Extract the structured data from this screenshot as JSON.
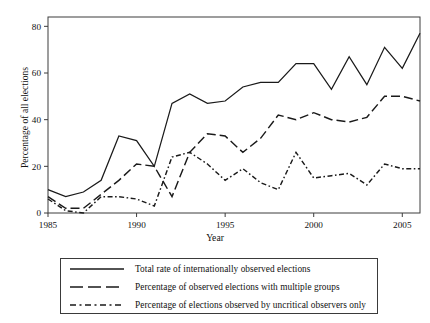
{
  "chart_data": {
    "type": "line",
    "title": "",
    "xlabel": "Year",
    "ylabel": "Percentage of all elections",
    "xlim": [
      1985,
      2006
    ],
    "ylim": [
      0,
      84
    ],
    "yticks": [
      0,
      20,
      40,
      60,
      80
    ],
    "xticks": [
      1985,
      1990,
      1995,
      2000,
      2005
    ],
    "grid": false,
    "legend_position": "below-axes",
    "x": [
      1985,
      1986,
      1987,
      1988,
      1989,
      1990,
      1991,
      1992,
      1993,
      1994,
      1995,
      1996,
      1997,
      1998,
      1999,
      2000,
      2001,
      2002,
      2003,
      2004,
      2005,
      2006
    ],
    "series": [
      {
        "name": "Total rate of internationally observed elections",
        "style": "solid",
        "values": [
          10,
          7,
          9,
          14,
          33,
          31,
          20,
          47,
          51,
          47,
          48,
          54,
          56,
          56,
          64,
          64,
          53,
          67,
          55,
          71,
          62,
          77
        ]
      },
      {
        "name": "Percentage of observed elections with multiple groups",
        "style": "dashed",
        "values": [
          7,
          2,
          2,
          8,
          14,
          21,
          20,
          7,
          26,
          34,
          33,
          26,
          32,
          42,
          40,
          43,
          40,
          39,
          41,
          50,
          50,
          48
        ]
      },
      {
        "name": "Percentage of elections observed by uncritical observers only",
        "style": "dash-dot",
        "values": [
          6,
          1,
          0,
          7,
          7,
          6,
          3,
          24,
          26,
          21,
          14,
          19,
          13,
          10,
          26,
          15,
          16,
          17,
          12,
          21,
          19,
          19
        ]
      }
    ]
  },
  "legend": {
    "items": [
      {
        "label": "Total rate of  internationally observed elections",
        "style": "solid"
      },
      {
        "label": "Percentage of  observed elections with multiple groups",
        "style": "dashed"
      },
      {
        "label": "Percentage of  elections observed by uncritical observers only",
        "style": "dash-dot"
      }
    ]
  },
  "axes": {
    "xlabel": "Year",
    "ylabel": "Percentage of all elections",
    "ytick_labels": [
      "0",
      "20",
      "40",
      "60",
      "80"
    ],
    "xtick_labels": [
      "1985",
      "1990",
      "1995",
      "2000",
      "2005"
    ]
  },
  "colors": {
    "line": "#1a1a1a",
    "frame": "#3c3c3c",
    "background": "#ffffff"
  }
}
